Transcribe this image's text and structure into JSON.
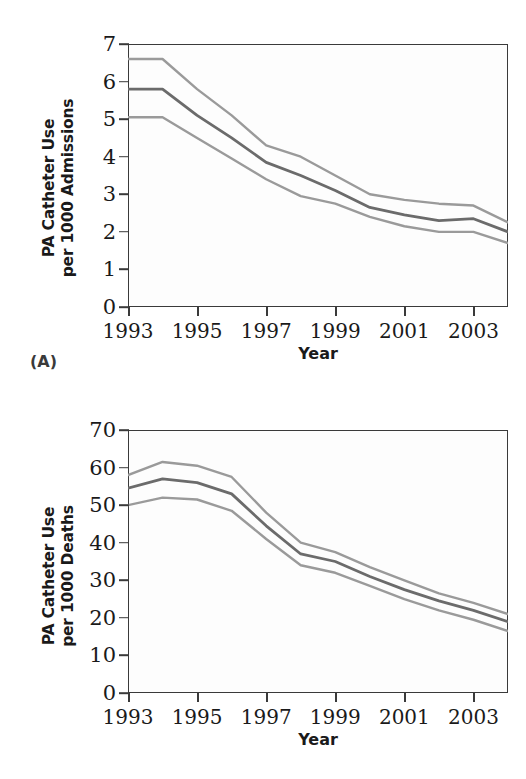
{
  "figure": {
    "panels": [
      {
        "tag": "(A)",
        "ylabel": "PA Catheter Use\nper 1000 Admissions",
        "xlabel": "Year"
      },
      {
        "tag": "(B)",
        "ylabel": "PA Catheter Use\nper 1000 Deaths",
        "xlabel": "Year"
      }
    ]
  },
  "colors": {
    "estimate_line": "#6b6b6b",
    "ci_line": "#9a9a9a",
    "axis": "#3a3a3a",
    "text": "#1a1a1a",
    "plot_background": "#fdfdfd"
  },
  "chart_data": [
    {
      "type": "line",
      "panel": "(A)",
      "title": "",
      "xlabel": "Year",
      "ylabel": "PA Catheter Use per 1000 Admissions",
      "xlim": [
        1993,
        2004
      ],
      "ylim": [
        0,
        7
      ],
      "yticks": [
        0,
        1,
        2,
        3,
        4,
        5,
        6,
        7
      ],
      "ytick_labels": [
        "0",
        "1",
        "2",
        "3",
        "4",
        "5",
        "6",
        "7"
      ],
      "xticks": [
        1993,
        1994,
        1995,
        1996,
        1997,
        1998,
        1999,
        2000,
        2001,
        2002,
        2003,
        2004
      ],
      "xtick_labels": [
        "1993",
        "",
        "1995",
        "",
        "1997",
        "",
        "1999",
        "",
        "2001",
        "",
        "2003",
        ""
      ],
      "grid": false,
      "legend": "none",
      "x": [
        1993,
        1994,
        1995,
        1996,
        1997,
        1998,
        1999,
        2000,
        2001,
        2002,
        2003,
        2004
      ],
      "series": [
        {
          "name": "Upper confidence limit",
          "color": "#9a9a9a",
          "values": [
            6.6,
            6.6,
            5.8,
            5.1,
            4.3,
            4.0,
            3.5,
            3.0,
            2.85,
            2.75,
            2.7,
            2.25
          ]
        },
        {
          "name": "Estimate",
          "color": "#6b6b6b",
          "values": [
            5.8,
            5.8,
            5.1,
            4.5,
            3.85,
            3.5,
            3.1,
            2.65,
            2.45,
            2.3,
            2.35,
            2.0
          ]
        },
        {
          "name": "Lower confidence limit",
          "color": "#9a9a9a",
          "values": [
            5.05,
            5.05,
            4.5,
            3.95,
            3.4,
            2.95,
            2.75,
            2.4,
            2.15,
            2.0,
            2.0,
            1.7
          ]
        }
      ]
    },
    {
      "type": "line",
      "panel": "(B)",
      "title": "",
      "xlabel": "Year",
      "ylabel": "PA Catheter Use per 1000 Deaths",
      "xlim": [
        1993,
        2004
      ],
      "ylim": [
        0,
        70
      ],
      "yticks": [
        0,
        10,
        20,
        30,
        40,
        50,
        60,
        70
      ],
      "ytick_labels": [
        "0",
        "10",
        "20",
        "30",
        "40",
        "50",
        "60",
        "70"
      ],
      "xticks": [
        1993,
        1994,
        1995,
        1996,
        1997,
        1998,
        1999,
        2000,
        2001,
        2002,
        2003,
        2004
      ],
      "xtick_labels": [
        "1993",
        "",
        "1995",
        "",
        "1997",
        "",
        "1999",
        "",
        "2001",
        "",
        "2003",
        ""
      ],
      "grid": false,
      "legend": "none",
      "x": [
        1993,
        1994,
        1995,
        1996,
        1997,
        1998,
        1999,
        2000,
        2001,
        2002,
        2003,
        2004
      ],
      "series": [
        {
          "name": "Upper confidence limit",
          "color": "#9a9a9a",
          "values": [
            58.0,
            61.5,
            60.5,
            57.5,
            48.0,
            40.0,
            37.5,
            33.5,
            30.0,
            26.5,
            24.0,
            21.0
          ]
        },
        {
          "name": "Estimate",
          "color": "#6b6b6b",
          "values": [
            54.5,
            57.0,
            56.0,
            53.0,
            44.5,
            37.0,
            35.0,
            31.0,
            27.5,
            24.5,
            22.0,
            19.0
          ]
        },
        {
          "name": "Lower confidence limit",
          "color": "#9a9a9a",
          "values": [
            50.0,
            52.0,
            51.5,
            48.5,
            41.0,
            34.0,
            32.0,
            28.5,
            25.0,
            22.0,
            19.5,
            16.5
          ]
        }
      ]
    }
  ]
}
